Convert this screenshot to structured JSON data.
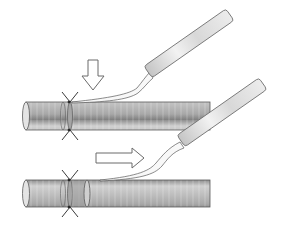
{
  "diagram": {
    "panels": [
      {
        "id": "top",
        "arrow_direction": "down",
        "step": "press down"
      },
      {
        "id": "bottom",
        "arrow_direction": "right",
        "step": "slide along"
      }
    ],
    "colors": {
      "outline": "#5a5a5a",
      "tube_light": "#d6d6d6",
      "tube_dark": "#9a9a9a",
      "handle_light": "#f2f2f2",
      "handle_dark": "#bdbdbd",
      "arrow_fill": "#ffffff",
      "thread": "#222222"
    }
  }
}
